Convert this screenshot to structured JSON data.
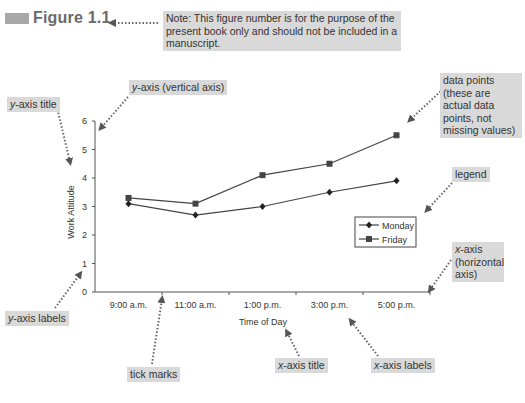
{
  "figure": {
    "label": "Figure 1.1.",
    "note": "Note: This figure number is for the purpose of the present book only and should not be included in a manuscript."
  },
  "annotations": {
    "y_axis_title": {
      "var": "y",
      "text": "-axis title"
    },
    "y_axis_vertical": {
      "var": "y",
      "text": "-axis (vertical axis)"
    },
    "data_points": "data points (these are actual data points, not missing values)",
    "legend": "legend",
    "x_axis_horizontal": {
      "var": "x",
      "text": "-axis (horizontal axis)"
    },
    "y_axis_labels": {
      "var": "y",
      "text": "-axis labels"
    },
    "tick_marks": "tick marks",
    "x_axis_title": {
      "var": "x",
      "text": "-axis title"
    },
    "x_axis_labels": {
      "var": "x",
      "text": "-axis labels"
    }
  },
  "chart_data": {
    "type": "line",
    "title": "",
    "xlabel": "Time of Day",
    "ylabel": "Work Attitude",
    "categories": [
      "9:00 a.m.",
      "11:00 a.m.",
      "1:00 p.m.",
      "3:00 p.m.",
      "5:00 p.m."
    ],
    "yticks": [
      0,
      1,
      2,
      3,
      4,
      5,
      6
    ],
    "ylim": [
      0,
      6
    ],
    "grid": false,
    "legend_position": "right-inside",
    "series": [
      {
        "name": "Monday",
        "marker": "diamond",
        "values": [
          3.1,
          2.7,
          3.0,
          3.5,
          3.9
        ]
      },
      {
        "name": "Friday",
        "marker": "square",
        "values": [
          3.3,
          3.1,
          4.1,
          4.5,
          5.5
        ]
      }
    ]
  }
}
